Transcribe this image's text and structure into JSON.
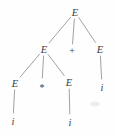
{
  "figure": {
    "kind": "parse-tree",
    "description_text": "",
    "colors": {
      "background": "#fefefe",
      "ink": "#3d3d3d",
      "edge": "#8a8a8a",
      "artifact": "#ededed"
    },
    "nodes": [
      {
        "id": "E-root",
        "label": "E",
        "x": 75,
        "y": 12
      },
      {
        "id": "E-left",
        "label": "E",
        "x": 44,
        "y": 49
      },
      {
        "id": "op-plus",
        "label": "+",
        "x": 72,
        "y": 50
      },
      {
        "id": "E-right",
        "label": "E",
        "x": 100,
        "y": 49
      },
      {
        "id": "E-left-left",
        "label": "E",
        "x": 15,
        "y": 83
      },
      {
        "id": "op-star",
        "label": "*",
        "x": 42,
        "y": 84
      },
      {
        "id": "E-left-right",
        "label": "E",
        "x": 69,
        "y": 82
      },
      {
        "id": "i-right",
        "label": "i",
        "x": 102,
        "y": 87
      },
      {
        "id": "i-left",
        "label": "i",
        "x": 13,
        "y": 121
      },
      {
        "id": "i-mid",
        "label": "i",
        "x": 70,
        "y": 122
      }
    ],
    "edges": [
      {
        "from": "E-root",
        "to": "E-left",
        "trimEnd": 8
      },
      {
        "from": "E-root",
        "to": "op-plus",
        "trimEnd": 6
      },
      {
        "from": "E-root",
        "to": "E-right",
        "trimEnd": 8
      },
      {
        "from": "E-left",
        "to": "E-left-left",
        "trimEnd": 8
      },
      {
        "from": "E-left",
        "to": "op-star",
        "trimEnd": 6
      },
      {
        "from": "E-left",
        "to": "E-left-right",
        "trimEnd": 8
      },
      {
        "from": "E-right",
        "to": "i-right",
        "trimEnd": 8
      },
      {
        "from": "E-left-left",
        "to": "i-left",
        "trimEnd": 8
      },
      {
        "from": "E-left-right",
        "to": "i-mid",
        "trimEnd": 8
      }
    ]
  }
}
